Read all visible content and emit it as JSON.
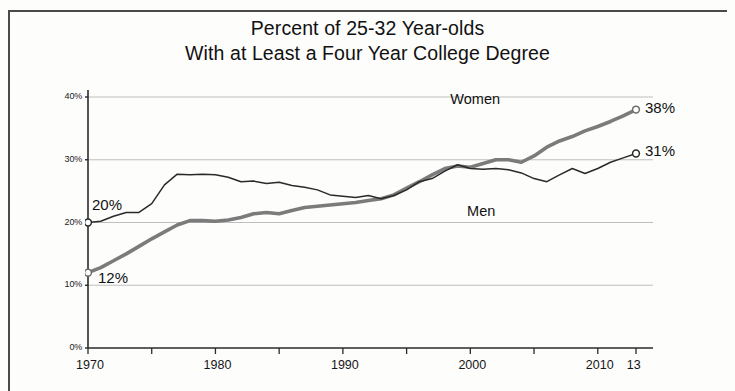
{
  "chart_data": {
    "type": "line",
    "title": "Percent of 25-32 Year-olds With at Least a Four Year College Degree",
    "title_lines": [
      "Percent of 25-32 Year-olds",
      "With at Least a Four Year College Degree"
    ],
    "xlabel": "",
    "ylabel": "",
    "xlim": [
      1970,
      2013
    ],
    "ylim": [
      0,
      40
    ],
    "grid": true,
    "legend_position": "inline-labels",
    "x_tick_labels": [
      "1970",
      "1980",
      "1990",
      "2000",
      "2010"
    ],
    "x_tick_values": [
      1970,
      1980,
      1990,
      2000,
      2010
    ],
    "x_end_suffix": "13",
    "y_tick_labels": [
      "0%",
      "10%",
      "20%",
      "30%",
      "40%"
    ],
    "y_tick_values": [
      0,
      10,
      20,
      30,
      40
    ],
    "series": [
      {
        "name": "Women",
        "label": "Women",
        "style": "thick-gray",
        "color": "#7b7b7b",
        "start_label": "12%",
        "end_label": "38%",
        "x": [
          1970,
          1971,
          1972,
          1973,
          1974,
          1975,
          1976,
          1977,
          1978,
          1979,
          1980,
          1981,
          1982,
          1983,
          1984,
          1985,
          1986,
          1987,
          1988,
          1989,
          1990,
          1991,
          1992,
          1993,
          1994,
          1995,
          1996,
          1997,
          1998,
          1999,
          2000,
          2001,
          2002,
          2003,
          2004,
          2005,
          2006,
          2007,
          2008,
          2009,
          2010,
          2011,
          2012,
          2013
        ],
        "values": [
          12.0,
          12.8,
          13.9,
          15.0,
          16.2,
          17.4,
          18.5,
          19.6,
          20.3,
          20.3,
          20.2,
          20.4,
          20.8,
          21.4,
          21.6,
          21.4,
          21.9,
          22.4,
          22.6,
          22.8,
          23.0,
          23.2,
          23.5,
          23.8,
          24.4,
          25.5,
          26.5,
          27.6,
          28.6,
          29.0,
          28.8,
          29.4,
          30.0,
          30.0,
          29.6,
          30.6,
          32.0,
          33.0,
          33.7,
          34.6,
          35.3,
          36.1,
          37.0,
          38.0
        ]
      },
      {
        "name": "Men",
        "label": "Men",
        "style": "thin-black",
        "color": "#2a2a2a",
        "start_label": "20%",
        "end_label": "31%",
        "x": [
          1970,
          1971,
          1972,
          1973,
          1974,
          1975,
          1976,
          1977,
          1978,
          1979,
          1980,
          1981,
          1982,
          1983,
          1984,
          1985,
          1986,
          1987,
          1988,
          1989,
          1990,
          1991,
          1992,
          1993,
          1994,
          1995,
          1996,
          1997,
          1998,
          1999,
          2000,
          2001,
          2002,
          2003,
          2004,
          2005,
          2006,
          2007,
          2008,
          2009,
          2010,
          2011,
          2012,
          2013
        ],
        "values": [
          20.0,
          20.2,
          21.0,
          21.6,
          21.6,
          23.0,
          26.0,
          27.7,
          27.6,
          27.7,
          27.6,
          27.2,
          26.5,
          26.6,
          26.2,
          26.4,
          25.9,
          25.6,
          25.2,
          24.4,
          24.2,
          24.0,
          24.3,
          23.8,
          24.3,
          25.2,
          26.5,
          27.0,
          28.2,
          29.2,
          28.6,
          28.5,
          28.6,
          28.4,
          27.9,
          27.0,
          26.5,
          27.6,
          28.6,
          27.8,
          28.6,
          29.6,
          30.3,
          31.0
        ]
      }
    ],
    "annotations": [
      {
        "name": "women-start",
        "text": "12%",
        "x": 1970,
        "y": 12.0
      },
      {
        "name": "men-start",
        "text": "20%",
        "x": 1970,
        "y": 20.0
      },
      {
        "name": "women-end",
        "text": "38%",
        "x": 2013,
        "y": 38.0
      },
      {
        "name": "men-end",
        "text": "31%",
        "x": 2013,
        "y": 31.0
      },
      {
        "name": "women-series",
        "text": "Women",
        "x": 2000,
        "y": 39.0
      },
      {
        "name": "men-series",
        "text": "Men",
        "x": 2001,
        "y": 21.5
      }
    ],
    "colors": {
      "women_line": "#7b7b7b",
      "men_line": "#2a2a2a",
      "gridline": "#b8b8b8",
      "axis": "#2a2a2a",
      "background": "#fdfdfc"
    }
  }
}
